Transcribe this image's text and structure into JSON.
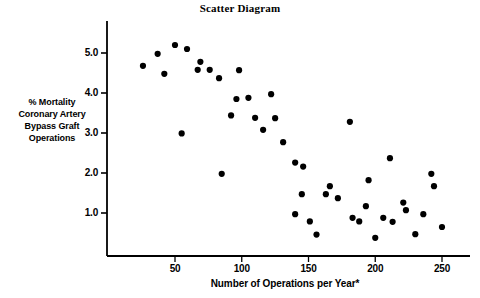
{
  "chart_data": {
    "type": "scatter",
    "title": "Scatter Diagram",
    "xlabel": "Number of Operations per Year*",
    "ylabel": "% Mortality Coronary Artery Bypass Graft Operations",
    "ylabel_lines": [
      "% Mortality",
      "Coronary Artery",
      "Bypass Graft",
      "Operations"
    ],
    "xlim": [
      18,
      272
    ],
    "ylim": [
      0.12,
      5.9
    ],
    "xticks": [
      50,
      100,
      150,
      200,
      250
    ],
    "xtick_labels": [
      "50",
      "100",
      "150",
      "200",
      "250"
    ],
    "yticks": [
      1.0,
      2.0,
      3.0,
      4.0,
      5.0
    ],
    "ytick_labels": [
      "1.0",
      "2.0",
      "3.0",
      "4.0",
      "5.0"
    ],
    "grid": false,
    "legend": false,
    "marker": "filled-circle",
    "marker_color": "#000000",
    "marker_size_px": 5,
    "axis_color": "#000000",
    "points": [
      [
        26,
        4.68
      ],
      [
        37,
        4.98
      ],
      [
        42,
        4.48
      ],
      [
        50,
        5.2
      ],
      [
        59,
        5.1
      ],
      [
        55,
        2.99
      ],
      [
        67,
        4.58
      ],
      [
        69,
        4.78
      ],
      [
        76,
        4.58
      ],
      [
        83,
        4.37
      ],
      [
        85,
        1.98
      ],
      [
        92,
        3.44
      ],
      [
        96,
        3.85
      ],
      [
        98,
        4.57
      ],
      [
        105,
        3.88
      ],
      [
        110,
        3.38
      ],
      [
        116,
        3.08
      ],
      [
        122,
        3.97
      ],
      [
        125,
        3.37
      ],
      [
        131,
        2.77
      ],
      [
        140,
        2.26
      ],
      [
        140,
        0.97
      ],
      [
        145,
        1.47
      ],
      [
        146,
        2.16
      ],
      [
        151,
        0.79
      ],
      [
        156,
        0.46
      ],
      [
        163,
        1.47
      ],
      [
        166,
        1.67
      ],
      [
        172,
        1.37
      ],
      [
        181,
        3.28
      ],
      [
        183,
        0.88
      ],
      [
        188,
        0.79
      ],
      [
        193,
        1.17
      ],
      [
        195,
        1.82
      ],
      [
        200,
        0.38
      ],
      [
        206,
        0.88
      ],
      [
        211,
        2.37
      ],
      [
        213,
        0.78
      ],
      [
        221,
        1.26
      ],
      [
        223,
        1.07
      ],
      [
        230,
        0.47
      ],
      [
        236,
        0.97
      ],
      [
        242,
        1.98
      ],
      [
        244,
        1.67
      ],
      [
        250,
        0.65
      ]
    ]
  }
}
